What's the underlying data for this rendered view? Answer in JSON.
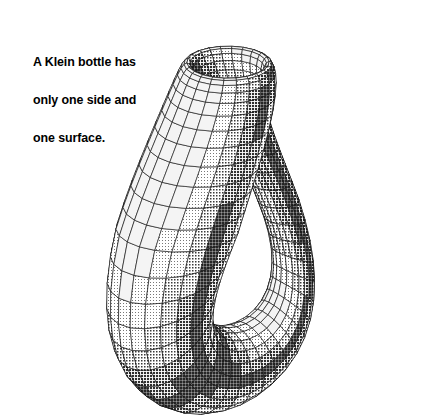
{
  "canvas": {
    "width": 441,
    "height": 417,
    "background": "#ffffff"
  },
  "caption": {
    "lines": [
      "A Klein bottle has",
      "only one side and",
      "one surface."
    ],
    "full_text": "A Klein bottle has only one side and one surface.",
    "color": "#000000"
  },
  "figure": {
    "style": "halftone-shaded wireframe",
    "line_color": "#111111",
    "light_fill": "#f2f2f2",
    "mid_fill": "#b9b9b9",
    "dark_fill": "#7a7a7a",
    "deep_fill": "#4e4e4e",
    "parts": [
      {
        "name": "mouth-rim",
        "label": "funnel mouth opening"
      },
      {
        "name": "neck",
        "label": "vertical neck"
      },
      {
        "name": "body",
        "label": "bulbous body"
      },
      {
        "name": "base-ring",
        "label": "torus base loop"
      },
      {
        "name": "left-arm",
        "label": "tapering left arm"
      },
      {
        "name": "right-lobe",
        "label": "right lower lobe"
      }
    ],
    "mesh": {
      "u_divisions": 48,
      "v_divisions": 22
    }
  }
}
